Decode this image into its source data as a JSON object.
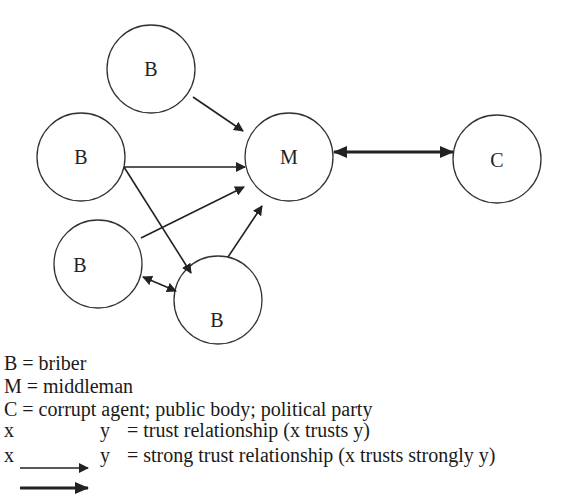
{
  "diagram": {
    "nodes": [
      {
        "id": "b1",
        "label": "B",
        "role": "briber",
        "cx": 151,
        "cy": 69,
        "r": 44
      },
      {
        "id": "b2",
        "label": "B",
        "role": "briber",
        "cx": 81,
        "cy": 157,
        "r": 44
      },
      {
        "id": "b3",
        "label": "B",
        "role": "briber",
        "cx": 98,
        "cy": 264,
        "r": 44
      },
      {
        "id": "b4",
        "label": "B",
        "role": "briber",
        "cx": 218,
        "cy": 300,
        "r": 44
      },
      {
        "id": "m",
        "label": "M",
        "role": "middleman",
        "cx": 289,
        "cy": 157,
        "r": 44
      },
      {
        "id": "c",
        "label": "C",
        "role": "corrupt agent",
        "cx": 497,
        "cy": 159,
        "r": 44
      }
    ],
    "edges": [
      {
        "from": "b1",
        "to": "m",
        "type": "trust",
        "direction": "one-way"
      },
      {
        "from": "b2",
        "to": "m",
        "type": "trust",
        "direction": "one-way"
      },
      {
        "from": "b2",
        "to": "b4",
        "type": "trust",
        "direction": "one-way"
      },
      {
        "from": "b3",
        "to": "m",
        "type": "trust",
        "direction": "one-way"
      },
      {
        "from": "b4",
        "to": "m",
        "type": "trust",
        "direction": "one-way"
      },
      {
        "from": "b3",
        "to": "b4",
        "type": "trust",
        "direction": "two-way"
      },
      {
        "from": "m",
        "to": "c",
        "type": "strong trust",
        "direction": "two-way"
      }
    ]
  },
  "legend": {
    "items": [
      {
        "text": "B = briber"
      },
      {
        "text": "M = middleman"
      },
      {
        "text": "C = corrupt agent; public body; political party"
      }
    ],
    "arrows": [
      {
        "x": "x",
        "y": "y",
        "desc": "= trust relationship (x trusts y)",
        "style": "thin"
      },
      {
        "x": "x",
        "y": "y",
        "desc": "= strong trust relationship (x trusts strongly y)",
        "style": "thick"
      }
    ]
  },
  "colors": {
    "stroke": "#222222",
    "background": "#ffffff"
  }
}
